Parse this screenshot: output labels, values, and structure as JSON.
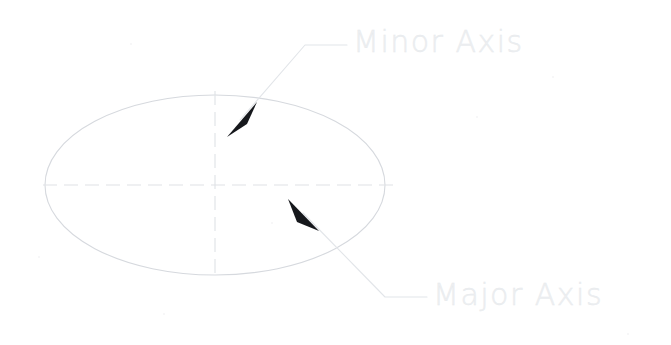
{
  "figure": {
    "background_color": "#ffffff",
    "width": 671,
    "height": 345
  },
  "labels": {
    "minor_axis": "Minor Axis",
    "major_axis": "Major Axis"
  },
  "colors": {
    "label_text": "#eef0f2",
    "ellipse_stroke": "#d8dade",
    "centerline_stroke": "#e2e4e8",
    "leader_stroke": "#e4e6ea",
    "arrowhead_fill": "#16181c"
  },
  "geometry": {
    "ellipse": {
      "center_x": 215,
      "center_y": 185,
      "radius_x": 170,
      "radius_y": 90
    },
    "major_axis_centerline": {
      "x1": 43,
      "y1": 185,
      "x2": 393,
      "y2": 185,
      "dash": "14 7"
    },
    "minor_axis_centerline": {
      "x1": 215,
      "y1": 91,
      "x2": 215,
      "y2": 280,
      "dash": "14 7"
    },
    "minor_leader": {
      "points": "240 120 305 45 347 45",
      "arrow_tip_x": 227,
      "arrow_tip_y": 137
    },
    "major_leader": {
      "points": "305 215 385 297 427 297",
      "arrow_tip_x": 288,
      "arrow_tip_y": 200
    },
    "minor_arrowhead": "227,137 256,103 248,122",
    "major_arrowhead": "288,200 318,230 298,223"
  },
  "specks": [
    {
      "x": 130,
      "y": 43,
      "size": 2
    },
    {
      "x": 476,
      "y": 116,
      "size": 2
    },
    {
      "x": 38,
      "y": 256,
      "size": 2
    },
    {
      "x": 163,
      "y": 313,
      "size": 2
    },
    {
      "x": 627,
      "y": 333,
      "size": 2
    },
    {
      "x": 271,
      "y": 222,
      "size": 2
    },
    {
      "x": 552,
      "y": 76,
      "size": 2
    }
  ]
}
